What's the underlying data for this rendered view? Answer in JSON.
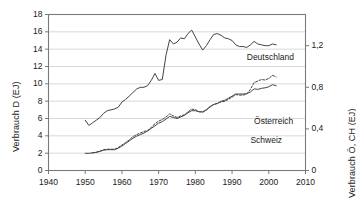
{
  "chart_data": {
    "type": "line",
    "title": "",
    "xlabel": "",
    "ylabel": "Verbrauch D (EJ)",
    "ylabel_right": "Verbrauch Ö, CH (EJ)",
    "xlim": [
      1940,
      2010
    ],
    "ylim": [
      0,
      18
    ],
    "ylim_right": [
      0,
      1.5
    ],
    "grid": true,
    "legend_position": "inline-right",
    "xticks": [
      1940,
      1950,
      1960,
      1970,
      1980,
      1990,
      2000,
      2010
    ],
    "xtick_labels": [
      "1940",
      "1950",
      "1960",
      "1970",
      "1980",
      "1990",
      "2000",
      "2010"
    ],
    "yticks_left": [
      0,
      2,
      4,
      6,
      8,
      10,
      12,
      14,
      16,
      18
    ],
    "ytick_labels_left": [
      "0",
      "2",
      "4",
      "6",
      "8",
      "10",
      "12",
      "14",
      "16",
      "18"
    ],
    "yticks_right": [
      0,
      0.4,
      0.8,
      1.2
    ],
    "ytick_labels_right": [
      "0",
      "0,4",
      "0,8",
      "1,2"
    ],
    "series": [
      {
        "name": "Deutschland",
        "axis": "left",
        "style": "solid",
        "color": "#444444",
        "x": [
          1950,
          1951,
          1952,
          1953,
          1954,
          1955,
          1956,
          1957,
          1958,
          1959,
          1960,
          1961,
          1962,
          1963,
          1964,
          1965,
          1966,
          1967,
          1968,
          1969,
          1970,
          1971,
          1972,
          1973,
          1974,
          1975,
          1976,
          1977,
          1978,
          1979,
          1980,
          1981,
          1982,
          1983,
          1984,
          1985,
          1986,
          1987,
          1988,
          1989,
          1990,
          1991,
          1992,
          1993,
          1994,
          1995,
          1996,
          1997,
          1998,
          1999,
          2000,
          2001,
          2002
        ],
        "values": [
          5.8,
          5.2,
          5.5,
          5.8,
          6.1,
          6.6,
          6.9,
          7.0,
          7.1,
          7.3,
          7.9,
          8.2,
          8.6,
          9.0,
          9.4,
          9.6,
          9.6,
          9.8,
          10.4,
          11.2,
          10.4,
          10.5,
          13.3,
          15.1,
          14.6,
          14.8,
          15.3,
          15.2,
          15.8,
          16.2,
          15.4,
          14.6,
          13.9,
          14.4,
          15.1,
          15.7,
          15.8,
          15.6,
          15.3,
          15.2,
          15.0,
          14.5,
          14.3,
          14.3,
          14.2,
          14.5,
          14.9,
          14.6,
          14.5,
          14.4,
          14.4,
          14.6,
          14.5
        ]
      },
      {
        "name": "Schweiz",
        "axis": "right",
        "style": "solid",
        "color": "#444444",
        "x": [
          1950,
          1951,
          1952,
          1953,
          1954,
          1955,
          1956,
          1957,
          1958,
          1959,
          1960,
          1961,
          1962,
          1963,
          1964,
          1965,
          1966,
          1967,
          1968,
          1969,
          1970,
          1971,
          1972,
          1973,
          1974,
          1975,
          1976,
          1977,
          1978,
          1979,
          1980,
          1981,
          1982,
          1983,
          1984,
          1985,
          1986,
          1987,
          1988,
          1989,
          1990,
          1991,
          1992,
          1993,
          1994,
          1995,
          1996,
          1997,
          1998,
          1999,
          2000,
          2001,
          2002
        ],
        "values": [
          0.165,
          0.165,
          0.17,
          0.175,
          0.185,
          0.195,
          0.2,
          0.2,
          0.2,
          0.215,
          0.235,
          0.26,
          0.285,
          0.31,
          0.33,
          0.345,
          0.36,
          0.38,
          0.405,
          0.43,
          0.455,
          0.47,
          0.495,
          0.52,
          0.51,
          0.5,
          0.515,
          0.53,
          0.555,
          0.575,
          0.575,
          0.565,
          0.565,
          0.585,
          0.615,
          0.635,
          0.645,
          0.665,
          0.675,
          0.695,
          0.715,
          0.735,
          0.735,
          0.735,
          0.74,
          0.755,
          0.785,
          0.78,
          0.79,
          0.795,
          0.805,
          0.825,
          0.815
        ]
      },
      {
        "name": "Österreich",
        "axis": "right",
        "style": "dashed",
        "color": "#444444",
        "x": [
          1952,
          1953,
          1954,
          1955,
          1956,
          1957,
          1958,
          1959,
          1960,
          1961,
          1962,
          1963,
          1964,
          1965,
          1966,
          1967,
          1968,
          1969,
          1970,
          1971,
          1972,
          1973,
          1974,
          1975,
          1976,
          1977,
          1978,
          1979,
          1980,
          1981,
          1982,
          1983,
          1984,
          1985,
          1986,
          1987,
          1988,
          1989,
          1990,
          1991,
          1992,
          1993,
          1994,
          1995,
          1996,
          1997,
          1998,
          1999,
          2000,
          2001,
          2002
        ],
        "values": [
          0.17,
          0.175,
          0.185,
          0.2,
          0.205,
          0.205,
          0.205,
          0.22,
          0.245,
          0.27,
          0.295,
          0.325,
          0.345,
          0.36,
          0.375,
          0.385,
          0.415,
          0.45,
          0.475,
          0.49,
          0.515,
          0.545,
          0.525,
          0.51,
          0.525,
          0.535,
          0.565,
          0.59,
          0.585,
          0.565,
          0.56,
          0.58,
          0.61,
          0.635,
          0.645,
          0.66,
          0.665,
          0.685,
          0.705,
          0.73,
          0.725,
          0.725,
          0.735,
          0.78,
          0.845,
          0.86,
          0.875,
          0.87,
          0.885,
          0.915,
          0.9
        ]
      }
    ],
    "annotations": [
      {
        "text": "Deutschland",
        "x": 1994,
        "y": 13.0
      },
      {
        "text": "Österreich",
        "x": 1996,
        "y": 5.6
      },
      {
        "text": "Schweiz",
        "x": 1995,
        "y": 3.35
      }
    ]
  },
  "labels": {
    "ylabel_left": "Verbrauch D (EJ)",
    "ylabel_right": "Verbrauch Ö, CH (EJ)",
    "series_deutschland": "Deutschland",
    "series_oesterreich": "Österreich",
    "series_schweiz": "Schweiz"
  },
  "colors": {
    "line": "#444444",
    "grid": "#cfcfcf",
    "axis": "#7a7a7a",
    "text": "#1a1a1a",
    "background": "#ffffff"
  }
}
